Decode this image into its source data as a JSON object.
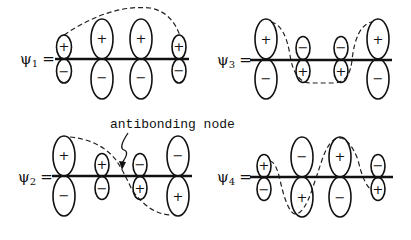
{
  "orbitals": [
    {
      "id": "psi1",
      "label": "ψ",
      "subscript": "1",
      "equals": "=",
      "lobes_top": [
        "+",
        "+",
        "+",
        "+"
      ],
      "lobes_bottom": [
        "−",
        "−",
        "−",
        "−"
      ],
      "sizes": [
        "small",
        "large",
        "large",
        "small"
      ]
    },
    {
      "id": "psi2",
      "label": "ψ",
      "subscript": "2",
      "equals": "=",
      "lobes_top": [
        "+",
        "+",
        "−",
        "−"
      ],
      "lobes_bottom": [
        "−",
        "−",
        "+",
        "+"
      ],
      "sizes": [
        "large",
        "small",
        "small",
        "large"
      ]
    },
    {
      "id": "psi3",
      "label": "ψ",
      "subscript": "3",
      "equals": "=",
      "lobes_top": [
        "+",
        "−",
        "−",
        "+"
      ],
      "lobes_bottom": [
        "−",
        "+",
        "+",
        "−"
      ],
      "sizes": [
        "large",
        "small",
        "small",
        "large"
      ]
    },
    {
      "id": "psi4",
      "label": "ψ",
      "subscript": "4",
      "equals": "=",
      "lobes_top": [
        "+",
        "−",
        "+",
        "−"
      ],
      "lobes_bottom": [
        "−",
        "+",
        "−",
        "+"
      ],
      "sizes": [
        "small",
        "large",
        "large",
        "small"
      ]
    }
  ],
  "annotation": {
    "text": "antibonding node"
  },
  "colors": {
    "ink": "#111111",
    "background": "#ffffff"
  }
}
